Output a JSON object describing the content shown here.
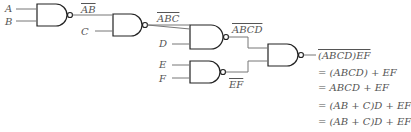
{
  "diagram": {
    "type": "logic-circuit",
    "inputs": [
      "A",
      "B",
      "C",
      "D",
      "E",
      "F"
    ],
    "labels": {
      "ab_bar": "AB",
      "abc_bar": "ABC",
      "abcd_bar": "ABCD",
      "ef_bar": "EF"
    },
    "equations": [
      "(ABCD)EF",
      "= (ABCD) + EF",
      "= ABCD + EF",
      "= (AB + C)D + EF",
      "= (AB + C)D + EF"
    ],
    "colors": {
      "line": "#222222",
      "text": "#555555",
      "wire": "#777777"
    }
  }
}
